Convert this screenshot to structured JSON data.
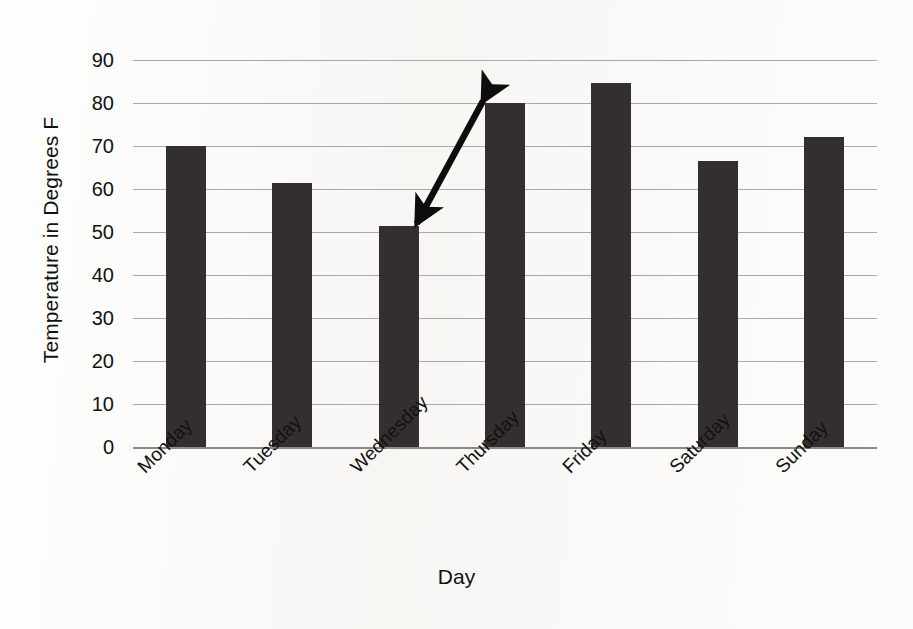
{
  "chart_data": {
    "type": "bar",
    "title": "",
    "xlabel": "Day",
    "ylabel": "Temperature in Degrees F",
    "categories": [
      "Monday",
      "Tuesday",
      "Wednesday",
      "Thursday",
      "Friday",
      "Saturday",
      "Sunday"
    ],
    "values": [
      70,
      61.5,
      51.5,
      80,
      84.7,
      66.5,
      72
    ],
    "ylim": [
      0,
      90
    ],
    "ytick_labels": [
      "0",
      "10",
      "20",
      "30",
      "40",
      "50",
      "60",
      "70",
      "80",
      "90"
    ],
    "ytick_values": [
      0,
      10,
      20,
      30,
      40,
      50,
      60,
      70,
      80,
      90
    ],
    "grid": true,
    "legend": false,
    "legend_position": "none",
    "xtick_label_rotation": -45,
    "bar_color": "#332f2f",
    "gridline_color": "#a9a9a9",
    "background_color": "#fbfbf9",
    "annotations": [
      {
        "name": "double-headed-arrow",
        "kind": "double-arrow",
        "from_category": "Wednesday",
        "to_category": "Thursday",
        "from_value": 51.5,
        "to_value": 80,
        "label": ""
      }
    ]
  },
  "axes": {
    "y_title": "Temperature in Degrees F",
    "x_title": "Day"
  }
}
